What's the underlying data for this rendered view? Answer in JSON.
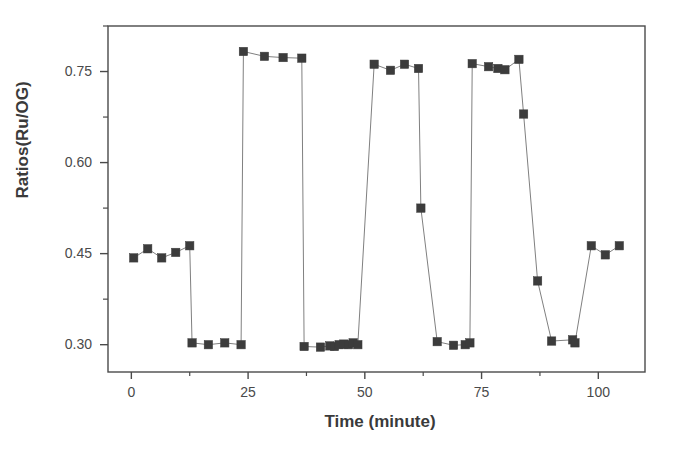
{
  "chart_data": {
    "type": "scatter",
    "title": "",
    "subtitle": "",
    "xlabel": "Time (minute)",
    "ylabel": "Ratios(Ru/OG)",
    "xlim": [
      -5,
      110
    ],
    "ylim": [
      0.255,
      0.825
    ],
    "xticks": [
      0,
      25,
      50,
      75,
      100
    ],
    "xtick_labels": [
      "0",
      "25",
      "50",
      "75",
      "100"
    ],
    "xminor_ticks": [
      12.5,
      37.5,
      62.5,
      87.5,
      112.5
    ],
    "yticks": [
      0.3,
      0.45,
      0.6,
      0.75
    ],
    "ytick_labels": [
      "0.30",
      "0.45",
      "0.60",
      "0.75"
    ],
    "yminor_ticks": [
      0.375,
      0.525,
      0.675,
      0.825
    ],
    "grid": false,
    "legend": null,
    "marker": "square",
    "marker_color": "#3c3c3c",
    "line_color": "#808080",
    "connected": true,
    "series": [
      {
        "name": "Ru/OG ratio",
        "x": [
          0.5,
          3.5,
          6.5,
          9.5,
          12.5,
          13.0,
          16.5,
          20.0,
          23.5,
          24.0,
          28.5,
          32.5,
          36.5,
          37.0,
          40.5,
          42.5,
          43.5,
          44.5,
          45.5,
          46.5,
          47.5,
          48.5,
          52.0,
          55.5,
          58.5,
          61.5,
          62.0,
          65.5,
          69.0,
          71.5,
          72.5,
          73.0,
          76.5,
          78.5,
          80.0,
          83.0,
          84.0,
          87.0,
          90.0,
          94.5,
          95.0,
          98.5,
          101.5,
          104.5
        ],
        "y": [
          0.443,
          0.458,
          0.443,
          0.452,
          0.463,
          0.303,
          0.3,
          0.303,
          0.3,
          0.783,
          0.775,
          0.773,
          0.772,
          0.297,
          0.296,
          0.298,
          0.297,
          0.3,
          0.301,
          0.3,
          0.303,
          0.3,
          0.762,
          0.752,
          0.762,
          0.755,
          0.525,
          0.305,
          0.299,
          0.3,
          0.303,
          0.763,
          0.758,
          0.755,
          0.753,
          0.77,
          0.68,
          0.405,
          0.306,
          0.308,
          0.303,
          0.463,
          0.448,
          0.463
        ]
      }
    ],
    "transitions": [
      {
        "from_index": 12,
        "to_index": 13,
        "note": "high-to-low step"
      },
      {
        "from_index": 23,
        "to_index": 24,
        "note": "low-to-high step"
      }
    ]
  },
  "axes": {
    "ylabel": "Ratios(Ru/OG)",
    "xlabel": "Time (minute)"
  }
}
